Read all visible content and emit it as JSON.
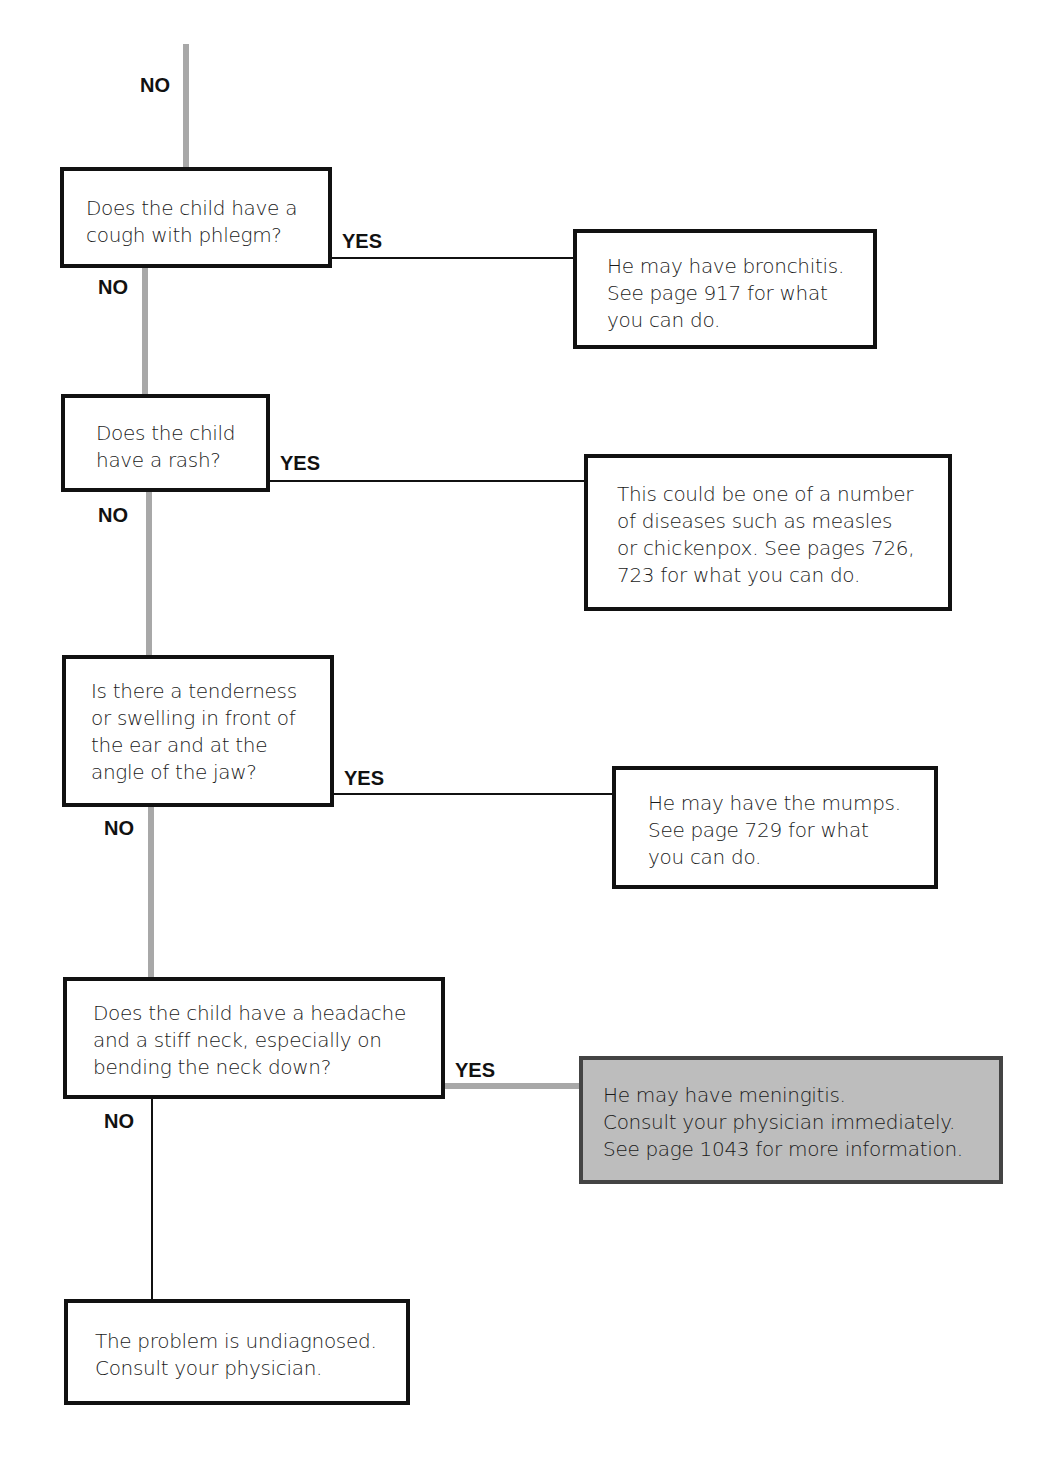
{
  "labels": {
    "yes": "YES",
    "no": "NO"
  },
  "questions": [
    {
      "id": "q1",
      "text": "Does the child have a\ncough with phlegm?"
    },
    {
      "id": "q2",
      "text": "Does the child\nhave a rash?"
    },
    {
      "id": "q3",
      "text": "Is there a tenderness\nor swelling in front of\nthe ear and at the\nangle of the jaw?"
    },
    {
      "id": "q4",
      "text": "Does the child have a headache\nand a stiff neck, especially on\nbending the neck down?"
    }
  ],
  "outcomes": [
    {
      "id": "o1",
      "text": "He may have bronchitis.\nSee page 917 for what\nyou can do."
    },
    {
      "id": "o2",
      "text": "This could be one of a number\nof diseases such as measles\nor chickenpox. See pages 726,\n723 for what you can do."
    },
    {
      "id": "o3",
      "text": "He may have the mumps.\nSee page 729 for what\nyou can do."
    },
    {
      "id": "o4",
      "text": "He may have meningitis.\nConsult your physician immediately.\nSee page 1043 for more information.",
      "highlight": true
    },
    {
      "id": "o5",
      "text": "The problem is undiagnosed.\nConsult your physician."
    }
  ],
  "colors": {
    "connector_gray": "#a8a8a8",
    "highlight_fill": "#bdbdbd",
    "border": "#111111"
  }
}
